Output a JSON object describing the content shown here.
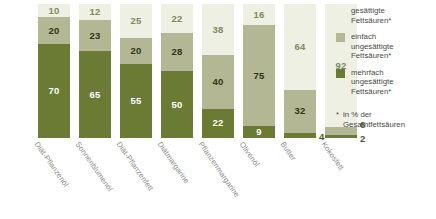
{
  "chart_data": {
    "type": "bar",
    "subtype": "stacked-100-percent",
    "title": "",
    "xlabel": "",
    "ylabel": "",
    "ylim": [
      0,
      100
    ],
    "grid": false,
    "legend_position": "right",
    "categories": [
      "Diät-Pflanzenöl",
      "Sonnenblumenöl",
      "Diät-Pflanzenfett",
      "Diätmargarine",
      "Pflanzenmargarine",
      "Olivenöl",
      "Butter",
      "Kokosfett"
    ],
    "series": [
      {
        "name": "gesättigte Fettsäuren*",
        "color": "#edf0e2",
        "values": [
          10,
          12,
          25,
          22,
          38,
          16,
          64,
          92
        ]
      },
      {
        "name": "einfach ungesättigte Fettsäuren*",
        "color": "#b3b793",
        "values": [
          20,
          23,
          20,
          28,
          40,
          75,
          32,
          6
        ]
      },
      {
        "name": "mehrfach ungesättigte Fettsäuren*",
        "color": "#6c7b33",
        "values": [
          70,
          65,
          55,
          50,
          22,
          9,
          4,
          2
        ]
      }
    ],
    "annotations": [
      "* in % der Gesamtfettsäuren"
    ]
  },
  "legend": {
    "items": [
      {
        "label": "gesättigte\nFettsäuren*",
        "line1": "gesättigte",
        "line2": "Fettsäuren*",
        "line3": ""
      },
      {
        "label": "einfach ungesättigte Fettsäuren*",
        "line1": "einfach",
        "line2": "ungesättigte",
        "line3": "Fettsäuren*"
      },
      {
        "label": "mehrfach ungesättigte Fettsäuren*",
        "line1": "mehrfach",
        "line2": "ungesättigte",
        "line3": "Fettsäuren*"
      }
    ]
  },
  "footnote": {
    "marker": "*",
    "line1": "in % der",
    "line2": "Gesamtfettsäuren"
  }
}
